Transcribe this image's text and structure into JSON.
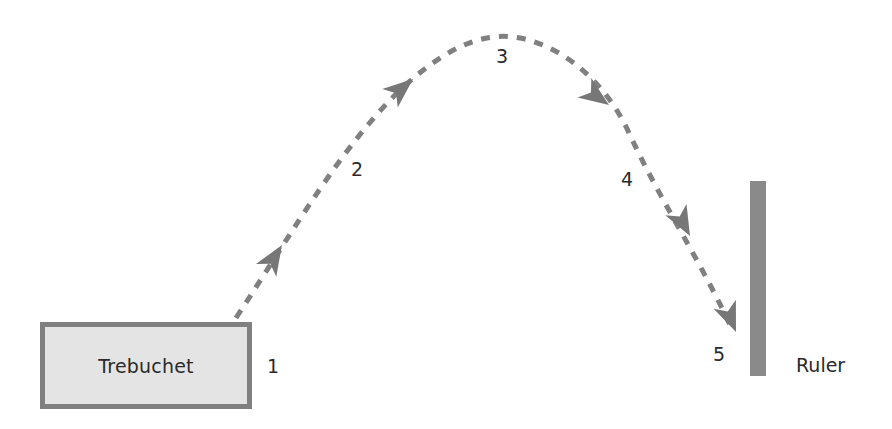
{
  "diagram": {
    "type": "trajectory",
    "source": {
      "label": "Trebuchet"
    },
    "target": {
      "label": "Ruler"
    },
    "points": [
      {
        "id": "1",
        "label": "1"
      },
      {
        "id": "2",
        "label": "2"
      },
      {
        "id": "3",
        "label": "3"
      },
      {
        "id": "4",
        "label": "4"
      },
      {
        "id": "5",
        "label": "5"
      }
    ],
    "colors": {
      "path": "#808080",
      "arrow": "#777777",
      "box_fill": "#e4e4e4",
      "box_border": "#808080",
      "ruler": "#8a8a8a",
      "text": "#2a2a2a"
    }
  }
}
